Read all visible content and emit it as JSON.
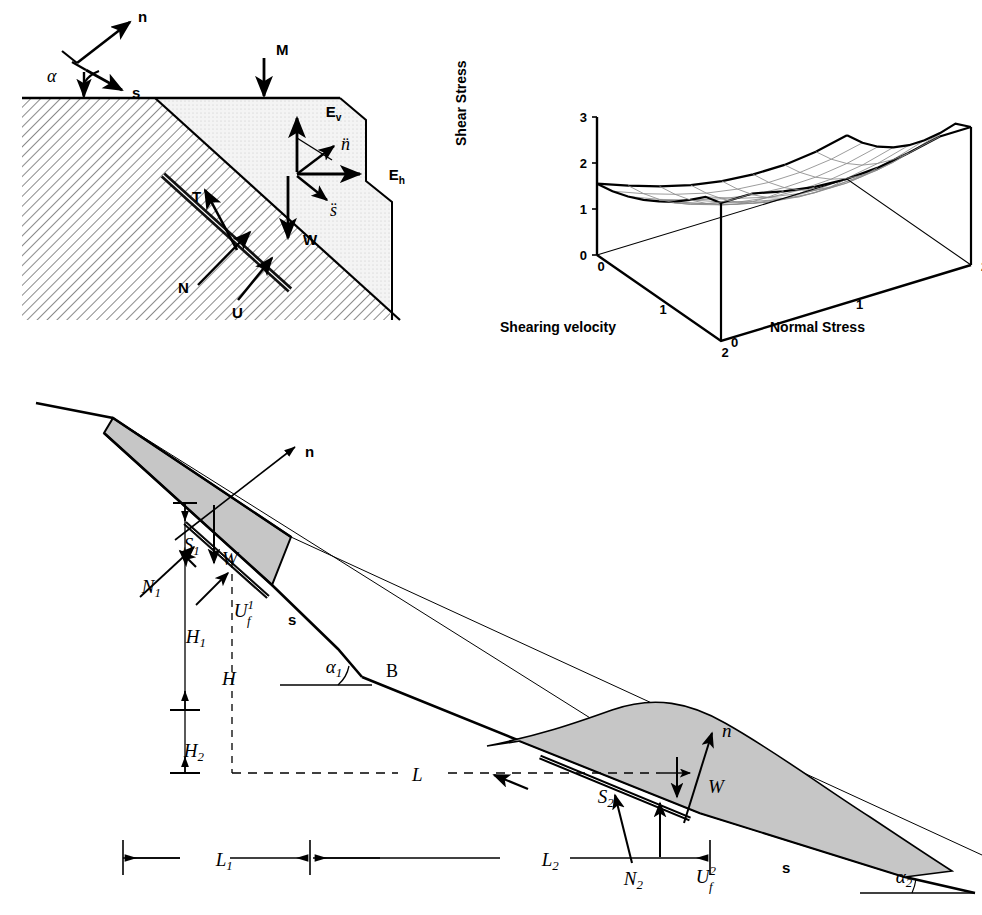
{
  "figure": {
    "panels": [
      "slope-force-diagram",
      "shear-strength-surface-3d",
      "two-wedge-slope-profile"
    ]
  },
  "panel_a": {
    "name": "slope-force-diagram",
    "labels": {
      "normal_axis": "n",
      "shear_axis": "s",
      "alpha": "α",
      "surcharge": "M",
      "vertical_force": "E",
      "vertical_force_sub": "v",
      "horizontal_force": "E",
      "horizontal_force_sub": "h",
      "accel_normal": "n̈",
      "accel_shear": "s̈",
      "shear_resistance": "T",
      "normal_force": "N",
      "uplift": "U",
      "weight": "W"
    }
  },
  "panel_b": {
    "name": "shear-strength-surface-3d",
    "chart_data": {
      "type": "surface",
      "title": "",
      "zlabel": "Shear Stress",
      "xlabel": "Shearing velocity",
      "ylabel": "Normal Stress",
      "zticks": [
        "0",
        "1",
        "2",
        "3"
      ],
      "zlim": [
        0,
        3
      ],
      "xticks": [
        "0",
        "1",
        "2"
      ],
      "xlim": [
        0,
        2
      ],
      "yticks": [
        "0",
        "1",
        "2"
      ],
      "ylim": [
        0,
        2
      ],
      "grid": true,
      "legend": "none",
      "x": [
        0,
        0.25,
        0.5,
        0.75,
        1.0,
        1.25,
        1.5,
        1.75,
        2.0
      ],
      "y": [
        0,
        0.25,
        0.5,
        0.75,
        1.0,
        1.25,
        1.5,
        1.75,
        2.0
      ],
      "z_description": "Shear stress rises with both shearing velocity and normal stress; saddle-like mesh lowest near the front (x=2,y=0) corner and highest at the far corners",
      "z": [
        [
          1.55,
          1.3,
          1.08,
          0.9,
          0.78,
          0.72,
          0.72,
          0.8,
          0.95
        ],
        [
          1.62,
          1.36,
          1.14,
          0.96,
          0.84,
          0.78,
          0.79,
          0.87,
          1.02
        ],
        [
          1.74,
          1.47,
          1.25,
          1.07,
          0.95,
          0.9,
          0.92,
          1.01,
          1.17
        ],
        [
          1.9,
          1.63,
          1.41,
          1.23,
          1.12,
          1.08,
          1.11,
          1.21,
          1.39
        ],
        [
          2.1,
          1.83,
          1.61,
          1.44,
          1.34,
          1.31,
          1.36,
          1.48,
          1.67
        ],
        [
          2.33,
          2.07,
          1.86,
          1.7,
          1.61,
          1.6,
          1.66,
          1.8,
          2.01
        ],
        [
          2.6,
          2.35,
          2.15,
          2.0,
          1.93,
          1.93,
          2.01,
          2.17,
          2.4
        ],
        [
          2.9,
          2.66,
          2.48,
          2.35,
          2.29,
          2.31,
          2.41,
          2.59,
          2.84
        ],
        [
          3.0,
          3.0,
          2.84,
          2.73,
          2.69,
          2.73,
          2.85,
          3.0,
          3.0
        ]
      ]
    }
  },
  "panel_c": {
    "name": "two-wedge-slope-profile",
    "labels": {
      "normal_upper": "n",
      "shear_upper": "s",
      "normal_lower": "n",
      "shear_lower": "s",
      "weight_upper": "W",
      "weight_lower": "W",
      "shear_force_1": "S",
      "shear_force_1_sub": "1",
      "shear_force_2": "S",
      "shear_force_2_sub": "2",
      "normal_force_1": "N",
      "normal_force_1_sub": "1",
      "normal_force_2": "N",
      "normal_force_2_sub": "2",
      "uplift_1": "U",
      "uplift_1_sub": "f",
      "uplift_1_sup": "1",
      "uplift_2": "U",
      "uplift_2_sub": "f",
      "uplift_2_sup": "2",
      "height_1": "H",
      "height_1_sub": "1",
      "height_2": "H",
      "height_2_sub": "2",
      "height_total": "H",
      "length_total": "L",
      "length_1": "L",
      "length_1_sub": "1",
      "length_2": "L",
      "length_2_sub": "2",
      "angle_1": "α",
      "angle_1_sub": "1",
      "angle_2": "α",
      "angle_2_sub": "2",
      "point_b": "B"
    }
  },
  "colors": {
    "ink": "#000000",
    "hatch": "#5a5a5a",
    "fill_light": "#f2f2f2",
    "fill_grey": "#b9b9b9",
    "mesh": "#7a7a7a"
  }
}
